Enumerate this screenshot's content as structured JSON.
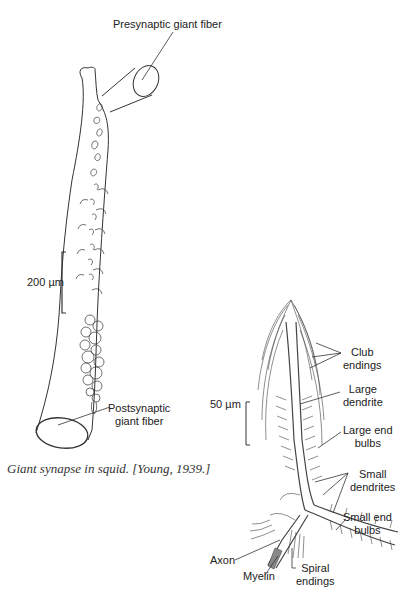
{
  "figure_left": {
    "title": "Giant synapse in squid",
    "labels": {
      "presynaptic": "Presynaptic giant fiber",
      "postsynaptic_line1": "Postsynaptic",
      "postsynaptic_line2": "giant fiber",
      "scale": "200 µm"
    },
    "caption": "Giant synapse in squid. [Young, 1939.]"
  },
  "figure_right": {
    "labels": {
      "scale": "50 µm",
      "club_line1": "Club",
      "club_line2": "endings",
      "large_dendrite_line1": "Large",
      "large_dendrite_line2": "dendrite",
      "large_end_bulbs_line1": "Large end",
      "large_end_bulbs_line2": "bulbs",
      "small_dendrites_line1": "Small",
      "small_dendrites_line2": "dendrites",
      "small_end_bulbs_line1": "Small end",
      "small_end_bulbs_line2": "bulbs",
      "axon": "Axon",
      "myelin": "Myelin",
      "spiral_line1": "Spiral",
      "spiral_line2": "endings"
    }
  },
  "colors": {
    "ink": "#222222",
    "background": "#ffffff"
  }
}
